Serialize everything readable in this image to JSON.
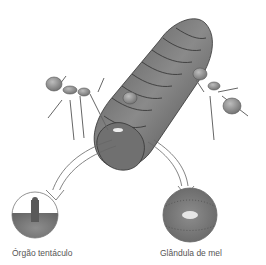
{
  "figure": {
    "labels": {
      "left": "Órgão tentáculo",
      "right": "Glândula de mel"
    }
  },
  "colors": {
    "caterpillar_body": "#6e6e6e",
    "caterpillar_dark": "#4a4a4a",
    "ant": "#8a8a8a",
    "circle_fill": "#7a7a7a",
    "background": "#ffffff"
  }
}
